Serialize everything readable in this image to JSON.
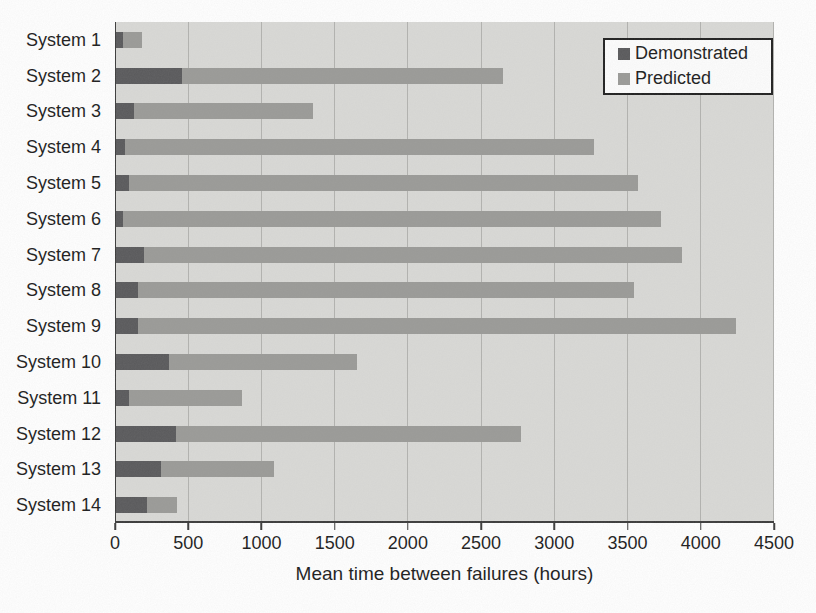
{
  "chart_data": {
    "type": "bar",
    "orientation": "horizontal",
    "title": "",
    "xlabel": "Mean time between failures (hours)",
    "ylabel": "",
    "xlim": [
      0,
      4500
    ],
    "xticks": [
      0,
      500,
      1000,
      1500,
      2000,
      2500,
      3000,
      3500,
      4000,
      4500
    ],
    "grid": "vertical gridlines every 500 hours",
    "bar_layout": "overlapped - Demonstrated bar drawn over Predicted bar, both starting at 0",
    "legend_position": "top-right inside plot",
    "categories": [
      "System 1",
      "System 2",
      "System 3",
      "System 4",
      "System 5",
      "System 6",
      "System 7",
      "System 8",
      "System 9",
      "System 10",
      "System 11",
      "System 12",
      "System 13",
      "System 14"
    ],
    "series": [
      {
        "name": "Demonstrated",
        "color": "#59595b",
        "values": [
          50,
          450,
          120,
          60,
          90,
          50,
          190,
          150,
          150,
          360,
          90,
          410,
          310,
          210
        ]
      },
      {
        "name": "Predicted",
        "color": "#9a9a97",
        "values": [
          180,
          2650,
          1350,
          3270,
          3570,
          3730,
          3870,
          3540,
          4240,
          1650,
          860,
          2770,
          1080,
          420
        ]
      }
    ]
  },
  "colors": {
    "plot_background": "#d9d9d6",
    "gridline": "#b2b2af",
    "axis": "#3a3a3a",
    "text": "#1b1b1b",
    "demonstrated": "#59595b",
    "predicted": "#9a9a97",
    "legend_background": "#fdfdfd",
    "legend_border": "#1f1f1f"
  }
}
